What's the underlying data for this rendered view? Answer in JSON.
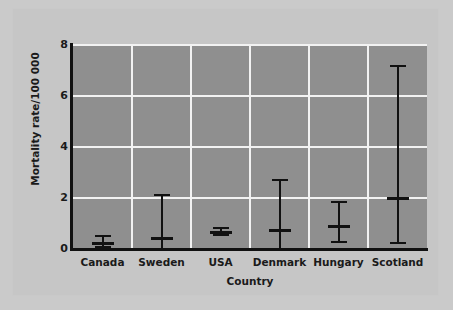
{
  "chart_data": {
    "type": "scatter",
    "title": "",
    "xlabel": "Country",
    "ylabel": "Mortality rate/100 000",
    "categories": [
      "Canada",
      "Sweden",
      "USA",
      "Denmark",
      "Hungary",
      "Scotland"
    ],
    "ylim": [
      0,
      8
    ],
    "yticks": [
      0,
      2,
      4,
      6,
      8
    ],
    "ytick_labels": [
      "0",
      "2",
      "4",
      "6",
      "8"
    ],
    "grid": "horizontal-and-vertical",
    "legend": "none",
    "plot_background": "#8f8f8f",
    "gridline_color": "#f2f2f2",
    "marker_color": "#111111",
    "series": [
      {
        "name": "Mortality rate with range",
        "values": [
          0.25,
          0.45,
          0.65,
          0.75,
          0.9,
          2.0
        ],
        "lower": [
          0.05,
          0.0,
          0.5,
          0.0,
          0.25,
          0.2
        ],
        "upper": [
          0.55,
          2.15,
          0.85,
          2.75,
          1.9,
          7.2
        ]
      }
    ],
    "points": [
      {
        "category": "Canada",
        "mean": 0.25,
        "lower": 0.05,
        "upper": 0.55
      },
      {
        "category": "Sweden",
        "mean": 0.45,
        "lower": 0.0,
        "upper": 2.15
      },
      {
        "category": "USA",
        "mean": 0.65,
        "lower": 0.5,
        "upper": 0.85
      },
      {
        "category": "Denmark",
        "mean": 0.75,
        "lower": 0.0,
        "upper": 2.75
      },
      {
        "category": "Hungary",
        "mean": 0.9,
        "lower": 0.25,
        "upper": 1.9
      },
      {
        "category": "Scotland",
        "mean": 2.0,
        "lower": 0.2,
        "upper": 7.2
      }
    ]
  }
}
